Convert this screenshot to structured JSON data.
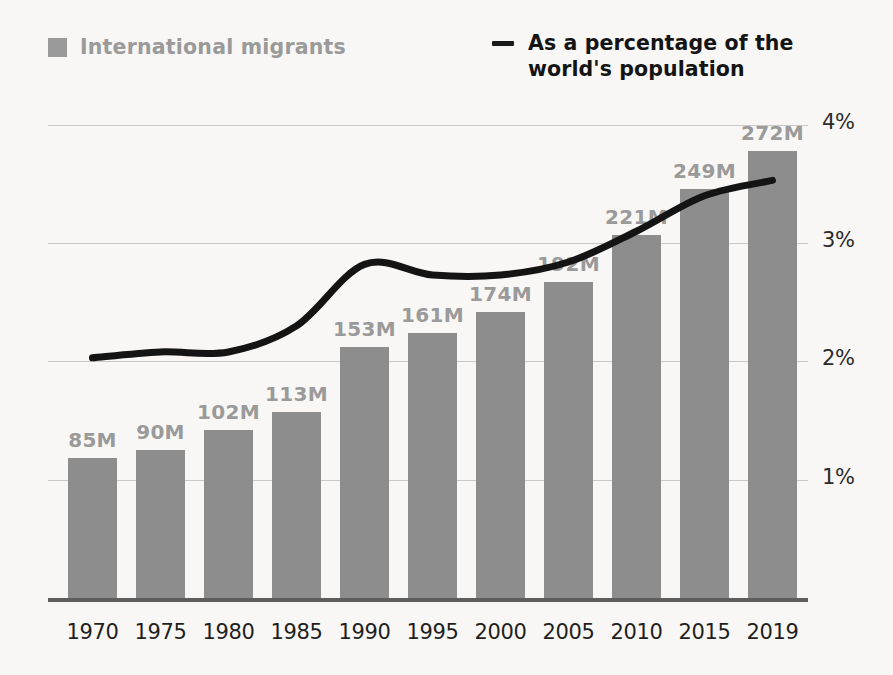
{
  "legend": {
    "bars": {
      "label": "International migrants",
      "swatch_color": "#9a9a9a",
      "icon": "square-swatch-icon"
    },
    "line": {
      "label": "As a percentage of the world's population",
      "line_color": "#141414",
      "icon": "dash-line-icon"
    }
  },
  "axis": {
    "y_ticks": [
      "4%",
      "3%",
      "2%",
      "1%"
    ],
    "x_ticks": [
      "1970",
      "1975",
      "1980",
      "1985",
      "1990",
      "1995",
      "2000",
      "2005",
      "2010",
      "2015",
      "2019"
    ]
  },
  "bar_labels": [
    "85M",
    "90M",
    "102M",
    "113M",
    "153M",
    "161M",
    "174M",
    "192M",
    "221M",
    "249M",
    "272M"
  ],
  "chart_data": {
    "type": "bar",
    "title": "",
    "subtitle": "",
    "xlabel": "",
    "ylabel": "",
    "grid": true,
    "legend_position": "top",
    "categories": [
      "1970",
      "1975",
      "1980",
      "1985",
      "1990",
      "1995",
      "2000",
      "2005",
      "2010",
      "2015",
      "2019"
    ],
    "series": [
      {
        "name": "International migrants",
        "type": "bar",
        "unit": "millions",
        "color": "#8d8d8d",
        "axis": "left",
        "values": [
          85,
          90,
          102,
          113,
          153,
          161,
          174,
          192,
          221,
          249,
          272
        ],
        "data_labels": [
          "85M",
          "90M",
          "102M",
          "113M",
          "153M",
          "161M",
          "174M",
          "192M",
          "221M",
          "249M",
          "272M"
        ]
      },
      {
        "name": "As a percentage of the world's population",
        "type": "line",
        "unit": "percent",
        "color": "#141414",
        "axis": "right",
        "values": [
          2.03,
          2.08,
          2.08,
          2.3,
          2.82,
          2.73,
          2.73,
          2.84,
          3.1,
          3.4,
          3.53
        ]
      }
    ],
    "ylim_left": [
      0,
      289
    ],
    "ylim_right": [
      0,
      4.06
    ],
    "y_tick_values_right": [
      1,
      2,
      3,
      4
    ],
    "y_tick_labels_right": [
      "1%",
      "2%",
      "3%",
      "4%"
    ]
  },
  "colors": {
    "background": "#f8f7f5",
    "bar": "#8d8d8d",
    "bar_label": "#9a9a9a",
    "line": "#141414",
    "gridline": "#c9c8c6",
    "baseline": "#5d5d5d",
    "axis_text": "#1f1f1f"
  }
}
